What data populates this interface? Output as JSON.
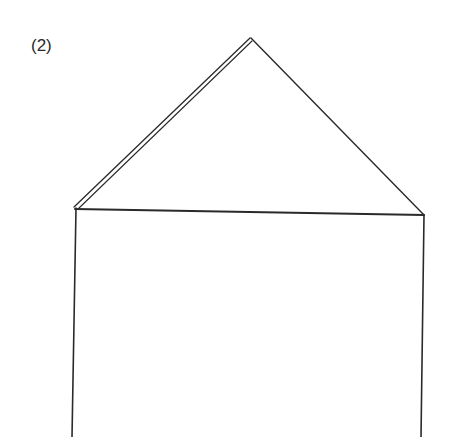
{
  "figure": {
    "label": "(2)",
    "stroke_color": "#2a2a2a",
    "background": "#ffffff"
  }
}
